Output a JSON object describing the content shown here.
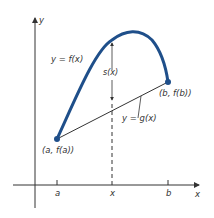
{
  "diagram": {
    "axes": {
      "y_label": "y",
      "x_label": "x"
    },
    "curve_label": "y = f(x)",
    "chord_label": "y = g(x)",
    "gap_label": "s(x)",
    "point_a_label": "(a, f(a))",
    "point_b_label": "(b, f(b))",
    "ticks": {
      "a": "a",
      "x": "x",
      "b": "b"
    },
    "colors": {
      "curve": "#1f4f8a",
      "ink": "#333333"
    }
  }
}
